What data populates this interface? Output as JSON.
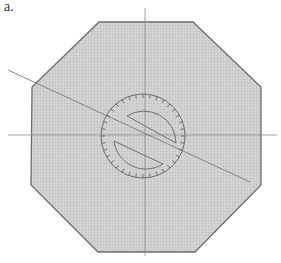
{
  "figure": {
    "label": "a."
  },
  "colors": {
    "background": "#ffffff",
    "octagon_fill": "#cfcfcf",
    "octagon_stroke": "#6e6e6e",
    "guide_line": "#8a8a8a",
    "protractor_stroke": "#707070",
    "label_text": "#333333"
  },
  "octagon": {
    "vertices": [
      [
        99,
        22
      ],
      [
        193,
        22
      ],
      [
        261,
        87
      ],
      [
        261,
        185
      ],
      [
        195,
        252
      ],
      [
        98,
        252
      ],
      [
        31,
        185
      ],
      [
        32,
        87
      ]
    ]
  },
  "guides": {
    "vertical": {
      "x": 145,
      "y1": 8,
      "y2": 256
    },
    "horizontal": {
      "y": 135,
      "x1": 8,
      "x2": 277
    },
    "diagonal": {
      "x1": 8,
      "y1": 70,
      "x2": 250,
      "y2": 182
    }
  },
  "protractor": {
    "center": [
      143,
      136
    ],
    "outer_radius": 42,
    "inner_radius": 32,
    "tick_count": 36
  }
}
